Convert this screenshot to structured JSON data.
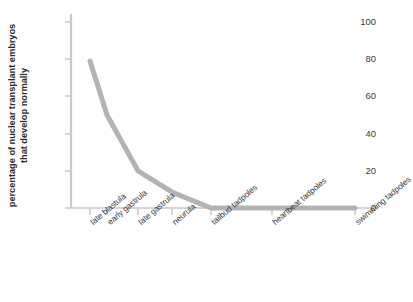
{
  "chart_data": {
    "type": "line",
    "title": "",
    "xlabel": "",
    "ylabel": "percentage of nuclear transplant embryos that develop normally",
    "categories": [
      "late blastula",
      "early gastrula",
      "late gastrula",
      "neurula",
      "tailbud tadpoles",
      "heartbeat tadpoles",
      "swimming tadpoles"
    ],
    "values": [
      79,
      50,
      20,
      8.5,
      0,
      0,
      0
    ],
    "ylim": [
      0,
      105
    ],
    "yticks": [
      0,
      20,
      40,
      60,
      80,
      100
    ],
    "ytick_labels": [
      "0",
      "20",
      "40",
      "60",
      "80",
      "100"
    ],
    "x_positions_px": [
      90,
      107,
      138,
      172,
      211,
      272,
      355
    ],
    "grid": false,
    "legend": false,
    "series": [
      {
        "name": "nuclear transplant embryos",
        "values": [
          79,
          50,
          20,
          8.5,
          0,
          0,
          0
        ],
        "color": "#b3b3b3",
        "line_width": 5,
        "markers": "none"
      }
    ],
    "axis_color": "#c8c8c8",
    "background": "#ffffff"
  }
}
